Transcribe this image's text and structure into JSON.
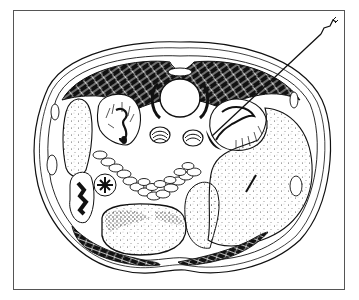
{
  "illustration": {
    "subject": "abdominal cross-section with percutaneous needle",
    "signature": "",
    "colors": {
      "ink": "#111111",
      "paper": "#ffffff",
      "frame": "#555555",
      "stipple": "#333333"
    },
    "structures": [
      {
        "name": "abdominal-wall-muscle",
        "label": ""
      },
      {
        "name": "vertebral-body",
        "label": ""
      },
      {
        "name": "left-kidney",
        "label": ""
      },
      {
        "name": "right-kidney",
        "label": ""
      },
      {
        "name": "aorta",
        "label": ""
      },
      {
        "name": "vena-cava",
        "label": ""
      },
      {
        "name": "liver",
        "label": ""
      },
      {
        "name": "spleen",
        "label": ""
      },
      {
        "name": "small-bowel-loops",
        "label": ""
      },
      {
        "name": "stomach",
        "label": ""
      },
      {
        "name": "colon",
        "label": ""
      },
      {
        "name": "needle",
        "label": ""
      }
    ]
  }
}
